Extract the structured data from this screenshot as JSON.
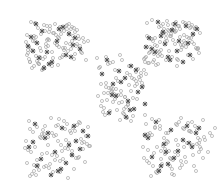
{
  "figure": {
    "background_color": "#ffffff",
    "width": 219,
    "height": 185,
    "has_axes": false,
    "has_frame": false,
    "has_title": false,
    "has_legend": false,
    "has_tick_labels": false,
    "has_gridlines": false
  },
  "chart_data": {
    "type": "scatter",
    "title": "",
    "subtitle": "",
    "xlabel": "",
    "ylabel": "",
    "xlim": [
      0,
      219
    ],
    "ylim": [
      0,
      185
    ],
    "grid": false,
    "legend_position": "none",
    "annotations": [],
    "tick_labels": {
      "x": [],
      "y": []
    },
    "cluster_layout": "quincunx",
    "cluster_count": 5,
    "marker_styles": [
      {
        "name": "points",
        "symbol": "circle-open",
        "color": "#b9b9b9",
        "edge_color": "#a8a8a8",
        "size": 3.1,
        "stroke_width": 0.7,
        "count": 430
      },
      {
        "name": "centroids",
        "symbol": "x-star",
        "color": "#5a5a5a",
        "edge_color": "#4f4f4f",
        "size": 3.4,
        "stroke_width": 0.9,
        "count": 88
      }
    ],
    "clusters": [
      {
        "name": "cluster-top-left",
        "center": [
          118,
          104
        ],
        "spread": [
          40,
          28
        ]
      },
      {
        "name": "cluster-top-right",
        "center": [
          355,
          104
        ],
        "spread": [
          40,
          28
        ]
      },
      {
        "name": "cluster-center",
        "center": [
          236,
          92
        ],
        "spread": [
          32,
          26
        ]
      },
      {
        "name": "cluster-bottom-left",
        "center": [
          118,
          80
        ],
        "spread": [
          40,
          28
        ]
      },
      {
        "name": "cluster-bottom-right",
        "center": [
          355,
          80
        ],
        "spread": [
          40,
          28
        ]
      }
    ],
    "series": [
      {
        "name": "points",
        "symbol": "circle-open",
        "color": "#b9b9b9",
        "x": [
          31,
          38,
          27,
          35,
          44,
          49,
          40,
          33,
          55,
          61,
          46,
          52,
          58,
          29,
          36,
          67,
          72,
          43,
          50,
          64,
          30,
          41,
          57,
          69,
          75,
          34,
          47,
          60,
          53,
          66,
          78,
          28,
          39,
          45,
          71,
          80,
          32,
          48,
          62,
          74,
          37,
          56,
          68,
          26,
          42,
          59,
          77,
          51,
          63,
          83,
          35,
          44,
          70,
          54,
          29,
          47,
          65,
          81,
          33,
          58,
          73,
          40,
          50,
          76,
          61,
          86,
          31,
          43,
          67,
          55,
          38,
          79,
          64,
          27,
          46,
          72,
          52,
          84,
          36,
          60,
          75,
          41,
          57,
          69,
          30,
          49,
          82,
          63,
          34,
          71,
          45,
          77,
          53,
          88,
          39,
          66,
          28,
          59,
          74,
          48,
          152,
          159,
          166,
          147,
          173,
          180,
          155,
          162,
          186,
          169,
          191,
          150,
          176,
          158,
          165,
          183,
          144,
          171,
          195,
          153,
          188,
          161,
          178,
          149,
          193,
          167,
          156,
          184,
          172,
          146,
          198,
          163,
          189,
          154,
          175,
          181,
          160,
          196,
          148,
          170,
          185,
          157,
          192,
          164,
          177,
          151,
          200,
          168,
          182,
          145,
          194,
          174,
          159,
          187,
          166,
          179,
          153,
          197,
          171,
          162,
          190,
          149,
          183,
          176,
          155,
          199,
          168,
          186,
          160,
          193,
          147,
          173,
          181,
          164,
          158,
          191,
          175,
          152,
          188,
          169,
          196,
          161,
          178,
          184,
          150,
          195,
          167,
          172,
          157,
          189,
          145,
          180,
          163,
          198,
          174,
          154,
          185,
          166,
          192,
          177,
          106,
          113,
          99,
          120,
          127,
          108,
          134,
          115,
          101,
          122,
          141,
          111,
          129,
          104,
          136,
          118,
          97,
          125,
          143,
          110,
          131,
          116,
          102,
          138,
          121,
          106,
          146,
          128,
          113,
          133,
          100,
          124,
          140,
          108,
          119,
          135,
          103,
          130,
          115,
          126,
          112,
          144,
          105,
          137,
          122,
          98,
          132,
          117,
          109,
          141,
          127,
          114,
          101,
          136,
          123,
          107,
          129,
          120,
          111,
          139,
          104,
          125,
          133,
          116,
          142,
          110,
          128,
          118,
          131,
          106,
          124,
          137,
          113,
          121,
          29,
          37,
          44,
          51,
          26,
          58,
          65,
          33,
          72,
          41,
          79,
          48,
          55,
          30,
          62,
          86,
          38,
          69,
          45,
          76,
          34,
          52,
          83,
          59,
          27,
          66,
          42,
          73,
          49,
          90,
          36,
          56,
          80,
          63,
          31,
          70,
          46,
          87,
          53,
          40,
          77,
          60,
          28,
          68,
          84,
          43,
          57,
          74,
          35,
          64,
          50,
          81,
          32,
          71,
          47,
          88,
          61,
          39,
          78,
          54,
          25,
          67,
          85,
          44,
          58,
          75,
          30,
          52,
          82,
          65,
          37,
          72,
          48,
          60,
          89,
          34,
          56,
          79,
          42,
          68,
          152,
          160,
          168,
          145,
          176,
          184,
          157,
          192,
          165,
          149,
          173,
          199,
          181,
          161,
          153,
          189,
          170,
          146,
          196,
          178,
          164,
          186,
          155,
          201,
          172,
          148,
          193,
          159,
          180,
          167,
          151,
          197,
          175,
          162,
          188,
          143,
          204,
          171,
          156,
          183,
          166,
          194,
          150,
          177,
          185,
          158,
          200,
          169,
          147,
          191,
          174,
          163,
          179,
          154,
          198,
          182,
          160,
          187,
          144,
          195,
          165,
          172,
          152,
          203,
          178,
          149,
          190,
          168,
          157,
          184,
          161,
          176,
          145,
          199,
          170,
          155,
          193,
          166,
          181,
          148,
          205,
          210,
          200,
          215,
          208,
          197,
          212,
          203
        ],
        "y": [
          22,
          28,
          35,
          41,
          25,
          32,
          48,
          38,
          24,
          30,
          44,
          52,
          37,
          47,
          56,
          29,
          41,
          59,
          26,
          50,
          62,
          34,
          45,
          33,
          54,
          66,
          40,
          27,
          58,
          43,
          36,
          53,
          64,
          31,
          49,
          46,
          68,
          39,
          57,
          28,
          61,
          35,
          51,
          42,
          70,
          47,
          30,
          63,
          55,
          38,
          23,
          67,
          44,
          33,
          59,
          26,
          48,
          52,
          41,
          65,
          36,
          57,
          29,
          46,
          34,
          60,
          50,
          69,
          25,
          43,
          63,
          39,
          31,
          55,
          47,
          27,
          66,
          42,
          37,
          58,
          32,
          51,
          45,
          24,
          62,
          40,
          53,
          48,
          36,
          29,
          57,
          44,
          33,
          41,
          64,
          26,
          50,
          38,
          59,
          46,
          20,
          27,
          34,
          23,
          40,
          29,
          45,
          33,
          25,
          51,
          38,
          47,
          31,
          56,
          42,
          22,
          59,
          36,
          28,
          62,
          44,
          50,
          26,
          53,
          35,
          21,
          65,
          41,
          30,
          57,
          48,
          24,
          38,
          60,
          32,
          45,
          54,
          27,
          63,
          36,
          23,
          51,
          42,
          29,
          66,
          39,
          33,
          25,
          47,
          58,
          44,
          31,
          52,
          37,
          60,
          26,
          41,
          49,
          34,
          56,
          28,
          63,
          45,
          22,
          38,
          53,
          30,
          47,
          42,
          59,
          36,
          24,
          50,
          33,
          64,
          27,
          44,
          39,
          55,
          31,
          48,
          26,
          60,
          35,
          52,
          29,
          41,
          57,
          46,
          23,
          62,
          37,
          33,
          49,
          28,
          54,
          43,
          38,
          25,
          59,
          57,
          62,
          68,
          55,
          73,
          64,
          79,
          70,
          84,
          60,
          76,
          88,
          66,
          93,
          72,
          81,
          58,
          97,
          86,
          63,
          91,
          78,
          101,
          69,
          95,
          83,
          74,
          105,
          89,
          98,
          67,
          109,
          80,
          93,
          103,
          86,
          112,
          75,
          99,
          107,
          91,
          70,
          115,
          84,
          102,
          96,
          78,
          110,
          88,
          73,
          118,
          94,
          106,
          81,
          113,
          100,
          85,
          120,
          92,
          77,
          108,
          97,
          116,
          89,
          83,
          111,
          104,
          95,
          121,
          87,
          114,
          99,
          102,
          91,
          121,
          127,
          134,
          118,
          141,
          125,
          148,
          132,
          155,
          138,
          122,
          145,
          160,
          129,
          151,
          136,
          165,
          143,
          126,
          158,
          171,
          133,
          149,
          119,
          163,
          140,
          154,
          128,
          168,
          146,
          175,
          135,
          123,
          159,
          152,
          131,
          166,
          144,
          172,
          137,
          125,
          161,
          150,
          178,
          142,
          130,
          156,
          169,
          147,
          121,
          164,
          139,
          174,
          133,
          153,
          127,
          145,
          170,
          158,
          136,
          148,
          124,
          162,
          167,
          141,
          131,
          176,
          155,
          143,
          129,
          160,
          151,
          137,
          172,
          146,
          165,
          126,
          157,
          134,
          149,
          119,
          126,
          133,
          115,
          140,
          129,
          147,
          122,
          154,
          136,
          160,
          143,
          118,
          151,
          166,
          131,
          158,
          124,
          171,
          145,
          138,
          162,
          127,
          149,
          174,
          134,
          155,
          120,
          168,
          141,
          176,
          130,
          152,
          164,
          123,
          147,
          137,
          159,
          172,
          128,
          144,
          166,
          133,
          125,
          157,
          170,
          140,
          151,
          161,
          132,
          175,
          146,
          122,
          153,
          138,
          165,
          129,
          143,
          158,
          126,
          149,
          169,
          135,
          120,
          155,
          163,
          131,
          142,
          173,
          147,
          159,
          124,
          136,
          152,
          166,
          128,
          145,
          133,
          161,
          150,
          140,
          133,
          147,
          128,
          152,
          144,
          136,
          158
        ]
      },
      {
        "name": "centroids",
        "symbol": "x-star",
        "color": "#5a5a5a",
        "x": [
          36,
          31,
          42,
          63,
          73,
          69,
          47,
          39,
          57,
          80,
          28,
          52,
          66,
          44,
          33,
          75,
          59,
          49,
          37,
          71,
          158,
          172,
          149,
          186,
          165,
          193,
          155,
          179,
          168,
          197,
          146,
          183,
          161,
          175,
          190,
          152,
          170,
          188,
          163,
          177,
          107,
          119,
          131,
          113,
          125,
          138,
          102,
          128,
          142,
          116,
          134,
          121,
          109,
          145,
          126,
          136,
          112,
          130,
          35,
          48,
          62,
          76,
          29,
          55,
          88,
          41,
          69,
          83,
          37,
          58,
          72,
          45,
          66,
          80,
          51,
          33,
          74,
          61,
          156,
          171,
          148,
          187,
          164,
          196,
          178,
          152,
          192,
          168,
          183,
          159,
          145,
          199,
          174,
          161,
          189,
          166
        ],
        "y": [
          24,
          37,
          31,
          27,
          45,
          34,
          52,
          58,
          41,
          49,
          46,
          62,
          55,
          68,
          51,
          38,
          29,
          64,
          43,
          57,
          22,
          30,
          38,
          26,
          44,
          34,
          52,
          41,
          57,
          29,
          47,
          62,
          36,
          24,
          55,
          49,
          60,
          43,
          32,
          51,
          60,
          71,
          66,
          84,
          78,
          92,
          74,
          101,
          87,
          96,
          109,
          82,
          113,
          104,
          117,
          70,
          95,
          110,
          124,
          133,
          128,
          141,
          147,
          152,
          136,
          159,
          145,
          131,
          166,
          171,
          155,
          138,
          163,
          149,
          175,
          142,
          126,
          169,
          122,
          130,
          138,
          126,
          144,
          133,
          151,
          157,
          147,
          164,
          140,
          171,
          135,
          128,
          158,
          166,
          143,
          152
        ]
      }
    ]
  }
}
